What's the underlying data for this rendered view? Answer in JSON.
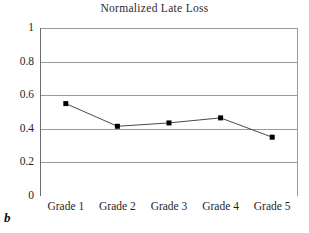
{
  "panel": {
    "label": "b"
  },
  "chart_data": {
    "type": "line",
    "title": "Normalized Late Loss",
    "xlabel": "",
    "ylabel": "",
    "categories": [
      "Grade 1",
      "Grade 2",
      "Grade 3",
      "Grade 4",
      "Grade 5"
    ],
    "values": [
      0.55,
      0.415,
      0.435,
      0.465,
      0.35
    ],
    "series": [
      {
        "name": "Normalized Late Loss",
        "values": [
          0.55,
          0.415,
          0.435,
          0.465,
          0.35
        ]
      }
    ],
    "ylim": [
      0,
      1
    ],
    "ytick_labels": [
      "1",
      "0.8",
      "0.6",
      "0.4",
      "0.2",
      "0"
    ],
    "ytick_values": [
      1,
      0.8,
      0.6,
      0.4,
      0.2,
      0
    ],
    "grid": "horizontal",
    "legend": "none",
    "marker": "square",
    "line_color": "#4a4a4a",
    "marker_color": "#000000",
    "grid_color": "#9a9a9a",
    "axis_color": "#6b6b6b",
    "background": "#ffffff"
  }
}
